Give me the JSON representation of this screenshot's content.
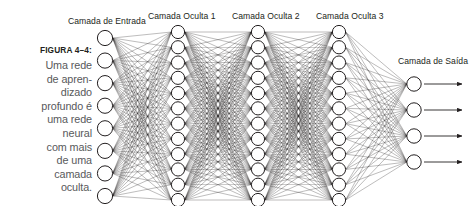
{
  "figure": {
    "number_label": "FIGURA 4–4:",
    "caption_lines": [
      "Uma rede",
      "de apren-",
      "dizado",
      "profundo é",
      "uma rede",
      "neural",
      "com mais",
      "de uma",
      "camada",
      "oculta."
    ],
    "caption_text": "Uma rede de aprendizado profundo é uma rede neural com mais de uma camada oculta."
  },
  "labels": {
    "input_layer": "Camada de Entrada",
    "hidden_layer_1": "Camada Oculta 1",
    "hidden_layer_2": "Camada Oculta 2",
    "hidden_layer_3": "Camada Oculta 3",
    "output_layer": "Camada de Saída"
  },
  "colors": {
    "stroke": "#231f20",
    "node_fill": "#ffffff",
    "caption_text": "#58595b",
    "label_text": "#231f20",
    "background": "#ffffff"
  },
  "network": {
    "type": "feedforward-neural-network",
    "layers": [
      {
        "name": "input",
        "node_count": 8,
        "cx": 105,
        "y_top": 38,
        "y_bottom": 196,
        "radius": 7.6
      },
      {
        "name": "hidden1",
        "node_count": 12,
        "cx": 178,
        "y_top": 32,
        "y_bottom": 200,
        "radius": 6.6
      },
      {
        "name": "hidden2",
        "node_count": 12,
        "cx": 258,
        "y_top": 32,
        "y_bottom": 200,
        "radius": 6.6
      },
      {
        "name": "hidden3",
        "node_count": 12,
        "cx": 339,
        "y_top": 32,
        "y_bottom": 200,
        "radius": 6.6
      },
      {
        "name": "output",
        "node_count": 4,
        "cx": 414,
        "y_top": 84,
        "y_bottom": 162,
        "radius": 7.2
      }
    ],
    "fully_connected": true,
    "output_arrows": {
      "count": 4,
      "from_x": 424,
      "to_x": 462,
      "direction": "right"
    }
  }
}
